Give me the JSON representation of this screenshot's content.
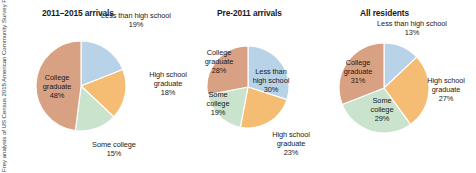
{
  "source_credit": {
    "line1": "Source: William H. Frey analysis of US Census 2015",
    "line2": "American Community Survey Public Use Microfile"
  },
  "colors": {
    "less_than_high_school": "#b8d3e8",
    "high_school_graduate": "#f5bd74",
    "some_college": "#c9e3cd",
    "college_graduate": "#d9a183",
    "slice_border": "#ffffff",
    "text": "#1a1a1a"
  },
  "chart_data": [
    {
      "type": "pie",
      "title": "2011–2015 arrivals",
      "categories": [
        "Less than high school",
        "High school graduate",
        "Some college",
        "College graduate"
      ],
      "values": [
        19,
        18,
        15,
        48
      ],
      "labels": [
        "19%",
        "18%",
        "15%",
        "48%"
      ],
      "colors": [
        "#b8d3e8",
        "#f5bd74",
        "#c9e3cd",
        "#d9a183"
      ],
      "start_angle": 0,
      "direction": "clockwise",
      "legend": "none",
      "label_position": [
        "outside",
        "outside",
        "outside",
        "inside"
      ]
    },
    {
      "type": "pie",
      "title": "Pre-2011 arrivals",
      "categories": [
        "Less than high school",
        "High school graduate",
        "Some college",
        "College graduate"
      ],
      "values": [
        30,
        23,
        19,
        28
      ],
      "labels": [
        "30%",
        "23%",
        "19%",
        "28%"
      ],
      "colors": [
        "#b8d3e8",
        "#f5bd74",
        "#c9e3cd",
        "#d9a183"
      ],
      "start_angle": 0,
      "direction": "clockwise",
      "legend": "none",
      "label_position": [
        "inside",
        "outside",
        "inside",
        "inside"
      ]
    },
    {
      "type": "pie",
      "title": "All residents",
      "categories": [
        "Less than high school",
        "High school graduate",
        "Some college",
        "College graduate"
      ],
      "values": [
        13,
        27,
        29,
        31
      ],
      "labels": [
        "13%",
        "27%",
        "29%",
        "31%"
      ],
      "colors": [
        "#b8d3e8",
        "#f5bd74",
        "#c9e3cd",
        "#d9a183"
      ],
      "start_angle": 0,
      "direction": "clockwise",
      "legend": "none",
      "label_position": [
        "outside",
        "outside",
        "inside",
        "inside"
      ]
    }
  ],
  "panels": [
    {
      "title": "2011–2015 arrivals",
      "radius": 45,
      "labels": {
        "less_than_high_school": {
          "name": "Less than high school",
          "pct": "19%"
        },
        "high_school_graduate": {
          "name1": "High school",
          "name2": "graduate",
          "pct": "18%"
        },
        "some_college": {
          "name": "Some college",
          "pct": "15%"
        },
        "college_graduate": {
          "name1": "College",
          "name2": "graduate",
          "pct": "48%"
        }
      }
    },
    {
      "title": "Pre-2011 arrivals",
      "radius": 41,
      "labels": {
        "less_than_high_school": {
          "name1": "Less than",
          "name2": "high school",
          "pct": "30%"
        },
        "high_school_graduate": {
          "name1": "High school",
          "name2": "graduate",
          "pct": "23%"
        },
        "some_college": {
          "name1": "Some",
          "name2": "college",
          "pct": "19%"
        },
        "college_graduate": {
          "name1": "College",
          "name2": "graduate",
          "pct": "28%"
        }
      }
    },
    {
      "title": "All residents",
      "radius": 45,
      "labels": {
        "less_than_high_school": {
          "name": "Less than high school",
          "pct": "13%"
        },
        "high_school_graduate": {
          "name1": "High school",
          "name2": "graduate",
          "pct": "27%"
        },
        "some_college": {
          "name1": "Some",
          "name2": "college",
          "pct": "29%"
        },
        "college_graduate": {
          "name1": "College",
          "name2": "graduate",
          "pct": "31%"
        }
      }
    }
  ]
}
